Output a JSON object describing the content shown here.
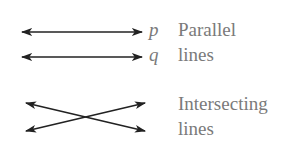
{
  "diagram": {
    "parallel": {
      "line_p_label": "p",
      "line_q_label": "q",
      "caption_line1": "Parallel",
      "caption_line2": "lines"
    },
    "intersecting": {
      "caption_line1": "Intersecting",
      "caption_line2": "lines"
    }
  },
  "colors": {
    "line": "#222222",
    "text": "#7a7a7a",
    "background": "#ffffff"
  }
}
